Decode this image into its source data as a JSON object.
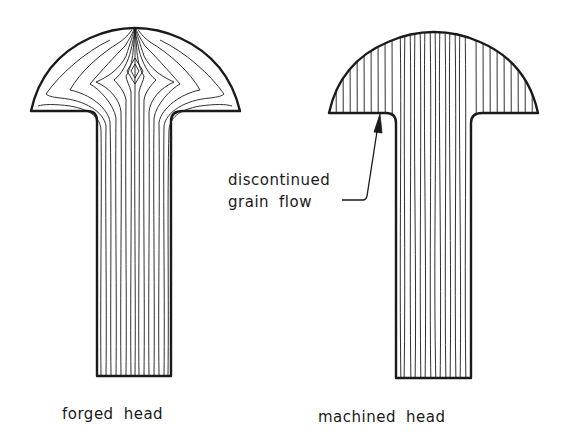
{
  "figure": {
    "left": {
      "caption_word1": "forged",
      "caption_word2": "head"
    },
    "right": {
      "caption_word1": "machined",
      "caption_word2": "head"
    },
    "annotation": {
      "line1": "discontinued",
      "line2_word1": "grain",
      "line2_word2": "flow"
    }
  },
  "colors": {
    "ink": "#1a1a1a",
    "background": "#ffffff"
  }
}
